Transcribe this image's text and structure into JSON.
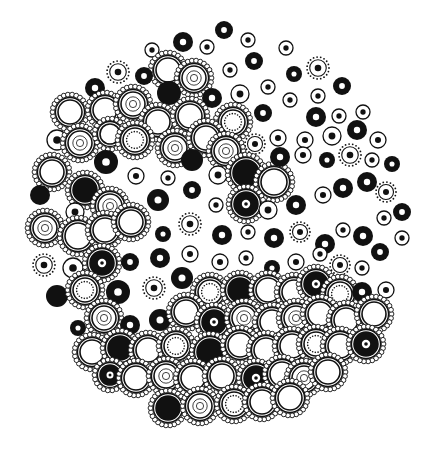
{
  "artwork": {
    "description": "Black ink doodle of circular cells arranged in a large round cluster",
    "ink_color": "#111111",
    "paper_color": "#ffffff",
    "width": 433,
    "height": 454,
    "cells": [
      {
        "x": 183,
        "y": 42,
        "r": 10,
        "t": "donut"
      },
      {
        "x": 224,
        "y": 30,
        "r": 9,
        "t": "donut"
      },
      {
        "x": 248,
        "y": 40,
        "r": 7,
        "t": "ring"
      },
      {
        "x": 207,
        "y": 47,
        "r": 7,
        "t": "ring"
      },
      {
        "x": 152,
        "y": 50,
        "r": 7,
        "t": "ring"
      },
      {
        "x": 286,
        "y": 48,
        "r": 7,
        "t": "ring"
      },
      {
        "x": 168,
        "y": 70,
        "r": 16,
        "t": "beaded"
      },
      {
        "x": 194,
        "y": 78,
        "r": 16,
        "t": "beadedconc"
      },
      {
        "x": 118,
        "y": 72,
        "r": 11,
        "t": "dotted"
      },
      {
        "x": 144,
        "y": 76,
        "r": 9,
        "t": "donut"
      },
      {
        "x": 95,
        "y": 88,
        "r": 10,
        "t": "donut"
      },
      {
        "x": 169,
        "y": 93,
        "r": 12,
        "t": "solid"
      },
      {
        "x": 230,
        "y": 70,
        "r": 7,
        "t": "ring"
      },
      {
        "x": 254,
        "y": 61,
        "r": 9,
        "t": "donut"
      },
      {
        "x": 212,
        "y": 98,
        "r": 10,
        "t": "donut"
      },
      {
        "x": 240,
        "y": 94,
        "r": 9,
        "t": "ring"
      },
      {
        "x": 268,
        "y": 87,
        "r": 7,
        "t": "ring"
      },
      {
        "x": 294,
        "y": 74,
        "r": 8,
        "t": "donut"
      },
      {
        "x": 318,
        "y": 68,
        "r": 11,
        "t": "dotted"
      },
      {
        "x": 342,
        "y": 86,
        "r": 9,
        "t": "donut"
      },
      {
        "x": 318,
        "y": 96,
        "r": 7,
        "t": "ring"
      },
      {
        "x": 290,
        "y": 100,
        "r": 7,
        "t": "ring"
      },
      {
        "x": 70,
        "y": 112,
        "r": 16,
        "t": "beaded"
      },
      {
        "x": 105,
        "y": 110,
        "r": 16,
        "t": "beaded"
      },
      {
        "x": 133,
        "y": 104,
        "r": 16,
        "t": "beadedconc"
      },
      {
        "x": 158,
        "y": 122,
        "r": 16,
        "t": "beaded"
      },
      {
        "x": 190,
        "y": 116,
        "r": 16,
        "t": "beaded"
      },
      {
        "x": 233,
        "y": 122,
        "r": 16,
        "t": "beadeddot"
      },
      {
        "x": 263,
        "y": 113,
        "r": 9,
        "t": "donut"
      },
      {
        "x": 316,
        "y": 117,
        "r": 10,
        "t": "donut"
      },
      {
        "x": 339,
        "y": 116,
        "r": 7,
        "t": "ring"
      },
      {
        "x": 363,
        "y": 112,
        "r": 7,
        "t": "ring"
      },
      {
        "x": 57,
        "y": 140,
        "r": 10,
        "t": "ring"
      },
      {
        "x": 80,
        "y": 143,
        "r": 16,
        "t": "beadedconc"
      },
      {
        "x": 110,
        "y": 134,
        "r": 14,
        "t": "beaded"
      },
      {
        "x": 135,
        "y": 140,
        "r": 16,
        "t": "beadeddot"
      },
      {
        "x": 175,
        "y": 148,
        "r": 16,
        "t": "beadedconc"
      },
      {
        "x": 206,
        "y": 138,
        "r": 16,
        "t": "beaded"
      },
      {
        "x": 226,
        "y": 151,
        "r": 16,
        "t": "beadedconc"
      },
      {
        "x": 255,
        "y": 144,
        "r": 10,
        "t": "dotted"
      },
      {
        "x": 278,
        "y": 138,
        "r": 8,
        "t": "ring"
      },
      {
        "x": 305,
        "y": 140,
        "r": 8,
        "t": "ring"
      },
      {
        "x": 332,
        "y": 136,
        "r": 9,
        "t": "ring"
      },
      {
        "x": 357,
        "y": 130,
        "r": 10,
        "t": "donut"
      },
      {
        "x": 378,
        "y": 140,
        "r": 8,
        "t": "ring"
      },
      {
        "x": 52,
        "y": 172,
        "r": 16,
        "t": "beaded"
      },
      {
        "x": 106,
        "y": 162,
        "r": 12,
        "t": "donut"
      },
      {
        "x": 136,
        "y": 176,
        "r": 8,
        "t": "ring"
      },
      {
        "x": 168,
        "y": 178,
        "r": 7,
        "t": "ring"
      },
      {
        "x": 192,
        "y": 160,
        "r": 11,
        "t": "solid"
      },
      {
        "x": 218,
        "y": 175,
        "r": 9,
        "t": "ring"
      },
      {
        "x": 246,
        "y": 173,
        "r": 17,
        "t": "beadedsolid"
      },
      {
        "x": 274,
        "y": 182,
        "r": 17,
        "t": "beaded"
      },
      {
        "x": 280,
        "y": 157,
        "r": 10,
        "t": "donut"
      },
      {
        "x": 303,
        "y": 155,
        "r": 8,
        "t": "ring"
      },
      {
        "x": 327,
        "y": 160,
        "r": 8,
        "t": "donut"
      },
      {
        "x": 350,
        "y": 155,
        "r": 11,
        "t": "dotted"
      },
      {
        "x": 372,
        "y": 160,
        "r": 7,
        "t": "ring"
      },
      {
        "x": 392,
        "y": 164,
        "r": 8,
        "t": "donut"
      },
      {
        "x": 40,
        "y": 195,
        "r": 10,
        "t": "solid"
      },
      {
        "x": 85,
        "y": 190,
        "r": 16,
        "t": "beadedsolid"
      },
      {
        "x": 75,
        "y": 212,
        "r": 9,
        "t": "ring"
      },
      {
        "x": 110,
        "y": 206,
        "r": 16,
        "t": "beadedconc"
      },
      {
        "x": 158,
        "y": 200,
        "r": 11,
        "t": "donut"
      },
      {
        "x": 192,
        "y": 190,
        "r": 9,
        "t": "donut"
      },
      {
        "x": 216,
        "y": 205,
        "r": 7,
        "t": "ring"
      },
      {
        "x": 246,
        "y": 204,
        "r": 16,
        "t": "beadeddonut"
      },
      {
        "x": 268,
        "y": 210,
        "r": 9,
        "t": "ring"
      },
      {
        "x": 296,
        "y": 205,
        "r": 10,
        "t": "donut"
      },
      {
        "x": 323,
        "y": 195,
        "r": 8,
        "t": "ring"
      },
      {
        "x": 343,
        "y": 188,
        "r": 10,
        "t": "donut"
      },
      {
        "x": 367,
        "y": 182,
        "r": 10,
        "t": "donut"
      },
      {
        "x": 386,
        "y": 192,
        "r": 10,
        "t": "dotted"
      },
      {
        "x": 45,
        "y": 228,
        "r": 16,
        "t": "beadedconc"
      },
      {
        "x": 78,
        "y": 236,
        "r": 17,
        "t": "beaded"
      },
      {
        "x": 105,
        "y": 230,
        "r": 16,
        "t": "beaded"
      },
      {
        "x": 131,
        "y": 222,
        "r": 16,
        "t": "beaded"
      },
      {
        "x": 163,
        "y": 234,
        "r": 8,
        "t": "donut"
      },
      {
        "x": 190,
        "y": 224,
        "r": 11,
        "t": "dotted"
      },
      {
        "x": 222,
        "y": 235,
        "r": 10,
        "t": "donut"
      },
      {
        "x": 248,
        "y": 232,
        "r": 7,
        "t": "ring"
      },
      {
        "x": 274,
        "y": 238,
        "r": 10,
        "t": "donut"
      },
      {
        "x": 300,
        "y": 232,
        "r": 10,
        "t": "dotted"
      },
      {
        "x": 325,
        "y": 244,
        "r": 10,
        "t": "donut"
      },
      {
        "x": 343,
        "y": 230,
        "r": 7,
        "t": "ring"
      },
      {
        "x": 363,
        "y": 236,
        "r": 10,
        "t": "donut"
      },
      {
        "x": 384,
        "y": 218,
        "r": 7,
        "t": "ring"
      },
      {
        "x": 402,
        "y": 212,
        "r": 9,
        "t": "donut"
      },
      {
        "x": 44,
        "y": 265,
        "r": 11,
        "t": "dotted"
      },
      {
        "x": 73,
        "y": 268,
        "r": 10,
        "t": "ring"
      },
      {
        "x": 102,
        "y": 263,
        "r": 16,
        "t": "beadeddonut"
      },
      {
        "x": 130,
        "y": 262,
        "r": 9,
        "t": "donut"
      },
      {
        "x": 160,
        "y": 258,
        "r": 10,
        "t": "donut"
      },
      {
        "x": 190,
        "y": 254,
        "r": 8,
        "t": "ring"
      },
      {
        "x": 220,
        "y": 262,
        "r": 8,
        "t": "ring"
      },
      {
        "x": 246,
        "y": 258,
        "r": 7,
        "t": "ring"
      },
      {
        "x": 272,
        "y": 268,
        "r": 8,
        "t": "donut"
      },
      {
        "x": 296,
        "y": 262,
        "r": 8,
        "t": "ring"
      },
      {
        "x": 320,
        "y": 254,
        "r": 7,
        "t": "ring"
      },
      {
        "x": 340,
        "y": 265,
        "r": 10,
        "t": "dotted"
      },
      {
        "x": 362,
        "y": 268,
        "r": 7,
        "t": "ring"
      },
      {
        "x": 380,
        "y": 252,
        "r": 9,
        "t": "donut"
      },
      {
        "x": 402,
        "y": 238,
        "r": 7,
        "t": "ring"
      },
      {
        "x": 57,
        "y": 296,
        "r": 11,
        "t": "solid"
      },
      {
        "x": 85,
        "y": 290,
        "r": 16,
        "t": "beadeddot"
      },
      {
        "x": 118,
        "y": 292,
        "r": 12,
        "t": "donut"
      },
      {
        "x": 154,
        "y": 288,
        "r": 11,
        "t": "dotted"
      },
      {
        "x": 182,
        "y": 278,
        "r": 11,
        "t": "donut"
      },
      {
        "x": 210,
        "y": 292,
        "r": 16,
        "t": "beadeddot"
      },
      {
        "x": 240,
        "y": 290,
        "r": 16,
        "t": "beadedsolid"
      },
      {
        "x": 268,
        "y": 290,
        "r": 16,
        "t": "beaded"
      },
      {
        "x": 294,
        "y": 292,
        "r": 16,
        "t": "beaded"
      },
      {
        "x": 316,
        "y": 284,
        "r": 16,
        "t": "beadeddonut"
      },
      {
        "x": 340,
        "y": 294,
        "r": 16,
        "t": "beadeddot"
      },
      {
        "x": 362,
        "y": 292,
        "r": 10,
        "t": "donut"
      },
      {
        "x": 386,
        "y": 290,
        "r": 8,
        "t": "ring"
      },
      {
        "x": 78,
        "y": 328,
        "r": 8,
        "t": "donut"
      },
      {
        "x": 104,
        "y": 318,
        "r": 16,
        "t": "beadedconc"
      },
      {
        "x": 130,
        "y": 325,
        "r": 10,
        "t": "donut"
      },
      {
        "x": 160,
        "y": 320,
        "r": 11,
        "t": "donut"
      },
      {
        "x": 186,
        "y": 312,
        "r": 16,
        "t": "beaded"
      },
      {
        "x": 214,
        "y": 322,
        "r": 16,
        "t": "beadeddonut"
      },
      {
        "x": 244,
        "y": 318,
        "r": 16,
        "t": "beadedconc"
      },
      {
        "x": 272,
        "y": 322,
        "r": 16,
        "t": "beaded"
      },
      {
        "x": 296,
        "y": 318,
        "r": 16,
        "t": "beadedconc"
      },
      {
        "x": 320,
        "y": 314,
        "r": 16,
        "t": "beaded"
      },
      {
        "x": 346,
        "y": 320,
        "r": 16,
        "t": "beaded"
      },
      {
        "x": 374,
        "y": 314,
        "r": 16,
        "t": "beaded"
      },
      {
        "x": 92,
        "y": 352,
        "r": 16,
        "t": "beaded"
      },
      {
        "x": 120,
        "y": 348,
        "r": 16,
        "t": "beadedsolid"
      },
      {
        "x": 148,
        "y": 350,
        "r": 16,
        "t": "beaded"
      },
      {
        "x": 176,
        "y": 346,
        "r": 16,
        "t": "beadeddot"
      },
      {
        "x": 210,
        "y": 352,
        "r": 17,
        "t": "beadedsolid"
      },
      {
        "x": 240,
        "y": 345,
        "r": 16,
        "t": "beaded"
      },
      {
        "x": 266,
        "y": 350,
        "r": 16,
        "t": "beaded"
      },
      {
        "x": 292,
        "y": 346,
        "r": 16,
        "t": "beaded"
      },
      {
        "x": 316,
        "y": 344,
        "r": 16,
        "t": "beadeddot"
      },
      {
        "x": 340,
        "y": 346,
        "r": 16,
        "t": "beaded"
      },
      {
        "x": 366,
        "y": 344,
        "r": 16,
        "t": "beadeddonut"
      },
      {
        "x": 110,
        "y": 375,
        "r": 14,
        "t": "beadeddonut"
      },
      {
        "x": 136,
        "y": 378,
        "r": 16,
        "t": "beaded"
      },
      {
        "x": 166,
        "y": 376,
        "r": 16,
        "t": "beadedconc"
      },
      {
        "x": 193,
        "y": 378,
        "r": 16,
        "t": "beaded"
      },
      {
        "x": 222,
        "y": 376,
        "r": 16,
        "t": "beaded"
      },
      {
        "x": 256,
        "y": 378,
        "r": 16,
        "t": "beadeddonut"
      },
      {
        "x": 282,
        "y": 374,
        "r": 16,
        "t": "beaded"
      },
      {
        "x": 304,
        "y": 378,
        "r": 16,
        "t": "beadedconc"
      },
      {
        "x": 328,
        "y": 372,
        "r": 16,
        "t": "beaded"
      },
      {
        "x": 168,
        "y": 408,
        "r": 16,
        "t": "beadedsolid"
      },
      {
        "x": 200,
        "y": 406,
        "r": 16,
        "t": "beadedconc"
      },
      {
        "x": 234,
        "y": 404,
        "r": 16,
        "t": "beadeddot"
      },
      {
        "x": 262,
        "y": 402,
        "r": 16,
        "t": "beaded"
      },
      {
        "x": 290,
        "y": 398,
        "r": 16,
        "t": "beaded"
      }
    ]
  }
}
